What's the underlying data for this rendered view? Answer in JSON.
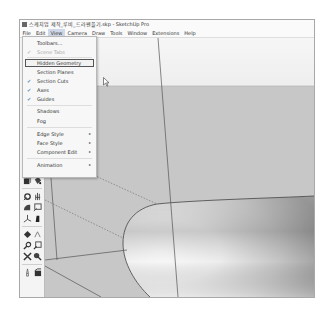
{
  "window": {
    "title": "스케치업 제작_루비_드라펜플기.skp - SketchUp Pro"
  },
  "menubar": {
    "items": [
      {
        "label": "File"
      },
      {
        "label": "Edit"
      },
      {
        "label": "View",
        "active": true
      },
      {
        "label": "Camera"
      },
      {
        "label": "Draw"
      },
      {
        "label": "Tools"
      },
      {
        "label": "Window"
      },
      {
        "label": "Extensions"
      },
      {
        "label": "Help"
      }
    ]
  },
  "view_menu": {
    "items": [
      {
        "label": "Toolbars...",
        "checked": false,
        "submenu": false,
        "disabled": false
      },
      {
        "label": "Scene Tabs",
        "checked": true,
        "submenu": false,
        "disabled": true
      },
      {
        "label": "Hidden Geometry",
        "checked": false,
        "submenu": false,
        "highlighted": true
      },
      {
        "label": "Section Planes",
        "checked": false,
        "submenu": false
      },
      {
        "label": "Section Cuts",
        "checked": true,
        "submenu": false
      },
      {
        "label": "Axes",
        "checked": true,
        "submenu": false
      },
      {
        "label": "Guides",
        "checked": true,
        "submenu": false
      },
      {
        "label": "Shadows",
        "checked": false,
        "submenu": false
      },
      {
        "label": "Fog",
        "checked": false,
        "submenu": false
      },
      {
        "label": "Edge Style",
        "checked": false,
        "submenu": true
      },
      {
        "label": "Face Style",
        "checked": false,
        "submenu": true
      },
      {
        "label": "Component Edit",
        "checked": false,
        "submenu": true
      },
      {
        "label": "Animation",
        "checked": false,
        "submenu": true
      }
    ],
    "check_glyph": "✔",
    "submenu_glyph": "▸"
  },
  "toolbar": {
    "tools": [
      "component-icon",
      "paint-bucket-icon",
      "orbit-icon",
      "pan-icon",
      "protractor-icon",
      "text-icon",
      "axes-icon",
      "dimension-icon",
      "section-plane-icon",
      "walk-icon",
      "zoom-icon",
      "zoom-window-icon",
      "zoom-extents-icon",
      "look-around-icon",
      "position-camera-icon",
      "previous-view-icon"
    ]
  },
  "colors": {
    "sky": "#f4f4f4",
    "ground": "#c6c6c6",
    "edge": "#555555",
    "menu_check": "#5a8ab8"
  }
}
